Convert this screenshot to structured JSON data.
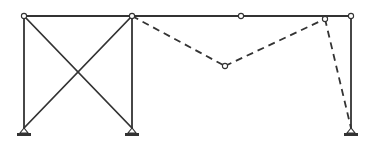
{
  "diagram": {
    "type": "structural-frame-mechanism",
    "colors": {
      "stroke": "#333333",
      "background": "#ffffff",
      "node_fill": "#ffffff"
    },
    "nodes": [
      {
        "id": "A",
        "x": 24,
        "y": 16
      },
      {
        "id": "B",
        "x": 132,
        "y": 16
      },
      {
        "id": "C",
        "x": 241,
        "y": 16
      },
      {
        "id": "D",
        "x": 351,
        "y": 16
      },
      {
        "id": "E",
        "x": 325,
        "y": 19
      },
      {
        "id": "F",
        "x": 225,
        "y": 66
      }
    ],
    "supports": [
      {
        "id": "S1",
        "x": 24,
        "y": 128
      },
      {
        "id": "S2",
        "x": 132,
        "y": 128
      },
      {
        "id": "S3",
        "x": 351,
        "y": 128
      }
    ],
    "solid_members": [
      {
        "from": [
          24,
          16
        ],
        "to": [
          351,
          16
        ]
      },
      {
        "from": [
          24,
          16
        ],
        "to": [
          24,
          128
        ]
      },
      {
        "from": [
          132,
          16
        ],
        "to": [
          132,
          128
        ]
      },
      {
        "from": [
          24,
          16
        ],
        "to": [
          132,
          128
        ]
      },
      {
        "from": [
          132,
          16
        ],
        "to": [
          24,
          128
        ]
      },
      {
        "from": [
          351,
          16
        ],
        "to": [
          351,
          128
        ]
      }
    ],
    "dashed_members": [
      {
        "from": [
          132,
          16
        ],
        "to": [
          225,
          66
        ]
      },
      {
        "from": [
          225,
          66
        ],
        "to": [
          325,
          19
        ]
      },
      {
        "from": [
          325,
          19
        ],
        "to": [
          351,
          128
        ]
      }
    ]
  }
}
